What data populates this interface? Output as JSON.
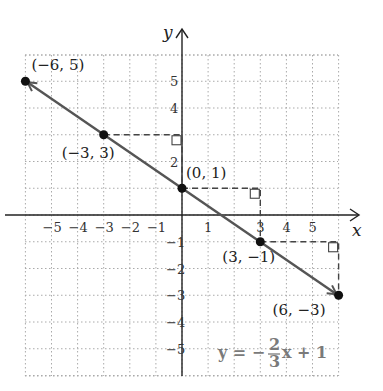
{
  "chart_data": {
    "type": "line",
    "title": "",
    "xlabel": "x",
    "ylabel": "y",
    "xlim": [
      -6,
      6
    ],
    "ylim": [
      -6,
      6
    ],
    "grid": true,
    "x_ticks": [
      "-5",
      "-4",
      "-3",
      "-2",
      "-1",
      "1",
      "3",
      "4",
      "5"
    ],
    "y_ticks": [
      "5",
      "4",
      "2",
      "-1",
      "-2",
      "-3",
      "-4",
      "-5"
    ],
    "equation": {
      "prefix": "y = −",
      "num": "2",
      "den": "3",
      "suffix": "x + 1"
    },
    "series": [
      {
        "name": "y = -2/3 x + 1",
        "color": "#555555",
        "points": [
          {
            "x": -6,
            "y": 5,
            "label": "(−6, 5)"
          },
          {
            "x": -3,
            "y": 3,
            "label": "(−3, 3)"
          },
          {
            "x": 0,
            "y": 1,
            "label": "(0, 1)"
          },
          {
            "x": 3,
            "y": -1,
            "label": "(3, −1)"
          },
          {
            "x": 6,
            "y": -3,
            "label": "(6, −3)"
          }
        ]
      }
    ],
    "annotations": [
      {
        "type": "slope-triangle",
        "run": 3,
        "rise": -2,
        "from": [
          -3,
          3
        ],
        "to": [
          0,
          1
        ]
      },
      {
        "type": "slope-triangle",
        "run": 3,
        "rise": -2,
        "from": [
          0,
          1
        ],
        "to": [
          3,
          -1
        ]
      },
      {
        "type": "slope-triangle",
        "run": 3,
        "rise": -2,
        "from": [
          3,
          -1
        ],
        "to": [
          6,
          -3
        ]
      }
    ]
  }
}
